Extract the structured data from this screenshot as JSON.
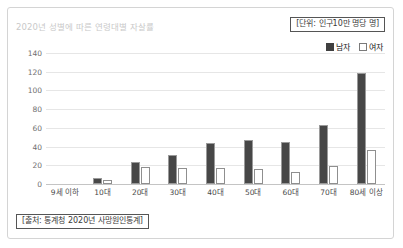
{
  "header": {
    "title": "2020년 성별에 따른 연령대별 자살률",
    "unit_note": "[단위: 인구10만 명당 명]"
  },
  "legend": {
    "male_label": "남자",
    "female_label": "여자",
    "male_color": "#474747",
    "female_color": "#ffffff"
  },
  "footer": {
    "source_note": "[출처: 통계청 2020년 사망원인통계]"
  },
  "chart_data": {
    "type": "bar",
    "title": "2020년 성별에 따른 연령대별 자살률",
    "xlabel": "",
    "ylabel": "",
    "unit": "인구10만 명당 명",
    "categories": [
      "9세 이하",
      "10대",
      "20대",
      "30대",
      "40대",
      "50대",
      "60대",
      "70대",
      "80세 이상"
    ],
    "series": [
      {
        "name": "남자",
        "values": [
          0,
          6,
          23,
          31,
          44,
          47,
          45,
          63,
          119
        ]
      },
      {
        "name": "여자",
        "values": [
          0,
          4,
          18,
          17,
          17,
          16,
          13,
          19,
          36
        ]
      }
    ],
    "ylim": [
      0,
      140
    ],
    "yticks": [
      0,
      20,
      40,
      60,
      80,
      100,
      120,
      140
    ],
    "ytick_labels": [
      "0",
      "20",
      "40",
      "60",
      "80",
      "100",
      "120",
      "140"
    ],
    "grid": true,
    "legend_position": "top-right",
    "source": "통계청 2020년 사망원인통계"
  }
}
